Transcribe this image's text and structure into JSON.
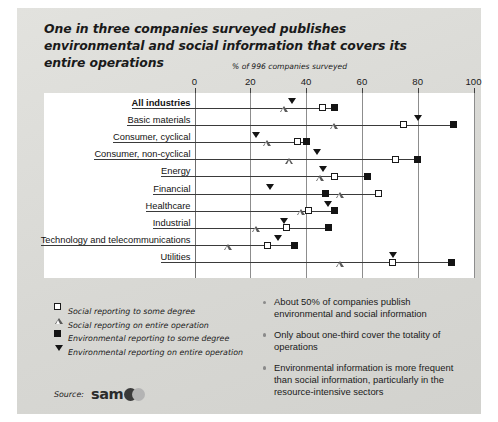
{
  "title": "One in three companies surveyed publishes environmental and social information that covers its entire operations",
  "source": {
    "label": "Source:",
    "logo_text": "sam"
  },
  "legend": [
    {
      "marker": "open-square",
      "label": "Social reporting to some degree"
    },
    {
      "marker": "open-triangle",
      "label": "Social reporting on entire operation"
    },
    {
      "marker": "filled-square",
      "label": "Environmental reporting to some degree"
    },
    {
      "marker": "filled-triangle-down",
      "label": "Environmental reporting on entire operation"
    }
  ],
  "bullets": [
    "About 50% of companies publish environmental and social information",
    "Only about one-third cover the totality of operations",
    "Environmental information is more frequent than social information, particularly in the resource-intensive sectors"
  ],
  "chart_data": {
    "type": "scatter",
    "title": "One in three companies surveyed publishes environmental and social information that covers its entire operations",
    "subtitle": "% of 996 companies surveyed",
    "xlabel": "% of 996 companies surveyed",
    "ylabel": "",
    "xlim": [
      0,
      100
    ],
    "xticks": [
      0,
      20,
      40,
      60,
      80,
      100
    ],
    "grid": true,
    "legend_position": "below-left",
    "categories": [
      "All industries",
      "Basic materials",
      "Consumer, cyclical",
      "Consumer, non-cyclical",
      "Energy",
      "Financial",
      "Healthcare",
      "Industrial",
      "Technology and telecommunications",
      "Utilities"
    ],
    "series": [
      {
        "name": "Social reporting to some degree",
        "marker": "open-square",
        "values": [
          46,
          75,
          37,
          72,
          50,
          66,
          41,
          33,
          26,
          71
        ]
      },
      {
        "name": "Social reporting on entire operation",
        "marker": "open-triangle",
        "values": [
          32,
          50,
          26,
          34,
          45,
          52,
          38,
          22,
          12,
          52
        ]
      },
      {
        "name": "Environmental reporting to some degree",
        "marker": "filled-square",
        "values": [
          50,
          93,
          40,
          80,
          62,
          47,
          50,
          48,
          36,
          92
        ]
      },
      {
        "name": "Environmental reporting on entire operation",
        "marker": "filled-triangle-down",
        "values": [
          35,
          80,
          22,
          44,
          46,
          27,
          48,
          32,
          30,
          71
        ]
      }
    ]
  }
}
